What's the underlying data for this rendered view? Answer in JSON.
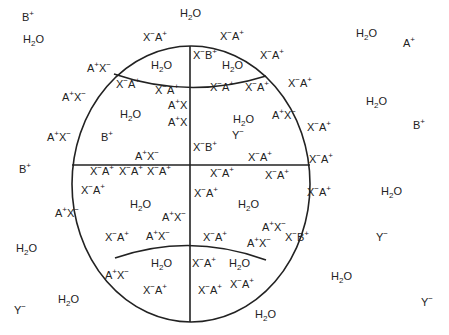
{
  "figure": {
    "stroke_color": "#222222",
    "background": "#ffffff"
  },
  "labels": [
    {
      "id": "out-b1",
      "text": "B+",
      "x": 22,
      "y": 16,
      "region": "outside"
    },
    {
      "id": "out-h2o1",
      "text": "H2O",
      "x": 180,
      "y": 12,
      "region": "outside"
    },
    {
      "id": "out-h2o2",
      "text": "H2O",
      "x": 23,
      "y": 38,
      "region": "outside"
    },
    {
      "id": "out-h2o3",
      "text": "H2O",
      "x": 356,
      "y": 32,
      "region": "outside"
    },
    {
      "id": "out-a1",
      "text": "A+",
      "x": 403,
      "y": 42,
      "region": "outside"
    },
    {
      "id": "out-h2o4",
      "text": "H2O",
      "x": 366,
      "y": 100,
      "region": "outside"
    },
    {
      "id": "out-b2",
      "text": "B+",
      "x": 413,
      "y": 124,
      "region": "outside"
    },
    {
      "id": "out-b3",
      "text": "B+",
      "x": 19,
      "y": 168,
      "region": "outside"
    },
    {
      "id": "out-h2o5",
      "text": "H2O",
      "x": 381,
      "y": 190,
      "region": "outside"
    },
    {
      "id": "out-y1",
      "text": "Y-",
      "x": 376,
      "y": 236,
      "region": "outside"
    },
    {
      "id": "out-h2o6",
      "text": "H2O",
      "x": 16,
      "y": 247,
      "region": "outside"
    },
    {
      "id": "out-h2o7",
      "text": "H2O",
      "x": 331,
      "y": 275,
      "region": "outside"
    },
    {
      "id": "out-h2o8",
      "text": "H2O",
      "x": 58,
      "y": 298,
      "region": "outside"
    },
    {
      "id": "out-y2",
      "text": "Y-",
      "x": 14,
      "y": 309,
      "region": "outside"
    },
    {
      "id": "out-y3",
      "text": "Y-",
      "x": 421,
      "y": 301,
      "region": "outside"
    },
    {
      "id": "out-h2o9",
      "text": "H2O",
      "x": 255,
      "y": 313,
      "region": "outside"
    },
    {
      "id": "r-xa-top1",
      "text": "X-A+",
      "x": 143,
      "y": 36,
      "region": "rim"
    },
    {
      "id": "r-xa-top2",
      "text": "X-A+",
      "x": 220,
      "y": 35,
      "region": "rim"
    },
    {
      "id": "r-ax-l1",
      "text": "A+X-",
      "x": 87,
      "y": 67,
      "region": "rim"
    },
    {
      "id": "r-xa-r1",
      "text": "X-A+",
      "x": 260,
      "y": 54,
      "region": "rim"
    },
    {
      "id": "r-ax-l2",
      "text": "A+X-",
      "x": 62,
      "y": 96,
      "region": "rim"
    },
    {
      "id": "r-xa-r2",
      "text": "X-A+",
      "x": 288,
      "y": 82,
      "region": "rim"
    },
    {
      "id": "r-ax-l3",
      "text": "A+X-",
      "x": 47,
      "y": 136,
      "region": "rim"
    },
    {
      "id": "r-xa-r3",
      "text": "X-A+",
      "x": 307,
      "y": 126,
      "region": "rim"
    },
    {
      "id": "r-xa-r4",
      "text": "X-A+",
      "x": 309,
      "y": 158,
      "region": "rim"
    },
    {
      "id": "r-ax-l4",
      "text": "A+X-",
      "x": 55,
      "y": 212,
      "region": "rim"
    },
    {
      "id": "r-xa-r5",
      "text": "X-A+",
      "x": 307,
      "y": 191,
      "region": "rim"
    },
    {
      "id": "r-xb-r1",
      "text": "X-B+",
      "x": 285,
      "y": 236,
      "region": "rim"
    },
    {
      "id": "r-ax-l5",
      "text": "A+X-",
      "x": 105,
      "y": 274,
      "region": "rim"
    },
    {
      "id": "r-xa-b1",
      "text": "X-A+",
      "x": 143,
      "y": 289,
      "region": "rim"
    },
    {
      "id": "r-xa-b2",
      "text": "X-A+",
      "x": 198,
      "y": 289,
      "region": "rim"
    },
    {
      "id": "r-xa-b3",
      "text": "X-A+",
      "x": 230,
      "y": 283,
      "region": "rim"
    },
    {
      "id": "i-xb1",
      "text": "X-B+",
      "x": 193,
      "y": 54,
      "region": "inside"
    },
    {
      "id": "i-h2o1",
      "text": "H2O",
      "x": 151,
      "y": 64,
      "region": "inside"
    },
    {
      "id": "i-h2o2",
      "text": "H2O",
      "x": 222,
      "y": 64,
      "region": "inside"
    },
    {
      "id": "i-xa1",
      "text": "X-A+",
      "x": 116,
      "y": 83,
      "region": "inside"
    },
    {
      "id": "i-xa2",
      "text": "X-A+",
      "x": 155,
      "y": 89,
      "region": "inside"
    },
    {
      "id": "i-xa3",
      "text": "X-A+",
      "x": 210,
      "y": 86,
      "region": "inside"
    },
    {
      "id": "i-xa4",
      "text": "X-A+",
      "x": 245,
      "y": 86,
      "region": "inside"
    },
    {
      "id": "i-ax1",
      "text": "A+X",
      "x": 168,
      "y": 104,
      "region": "inside"
    },
    {
      "id": "i-h2o3",
      "text": "H2O",
      "x": 120,
      "y": 113,
      "region": "inside"
    },
    {
      "id": "i-ax2",
      "text": "A+X",
      "x": 168,
      "y": 121,
      "region": "inside"
    },
    {
      "id": "i-h2o4",
      "text": "H2O",
      "x": 233,
      "y": 118,
      "region": "inside"
    },
    {
      "id": "i-ax3",
      "text": "A+X-",
      "x": 272,
      "y": 114,
      "region": "inside"
    },
    {
      "id": "i-b1",
      "text": "B+",
      "x": 101,
      "y": 136,
      "region": "inside"
    },
    {
      "id": "i-y1",
      "text": "Y-",
      "x": 232,
      "y": 134,
      "region": "inside"
    },
    {
      "id": "i-xb2",
      "text": "X-B+",
      "x": 193,
      "y": 146,
      "region": "inside"
    },
    {
      "id": "i-ax4",
      "text": "A+X-",
      "x": 135,
      "y": 155,
      "region": "inside"
    },
    {
      "id": "i-xa5",
      "text": "X-A+",
      "x": 248,
      "y": 156,
      "region": "inside"
    },
    {
      "id": "i-xa6",
      "text": "X-A+",
      "x": 90,
      "y": 170,
      "region": "inside"
    },
    {
      "id": "i-xa7",
      "text": "X-A+",
      "x": 119,
      "y": 170,
      "region": "inside"
    },
    {
      "id": "i-xa8",
      "text": "X-A+",
      "x": 147,
      "y": 170,
      "region": "inside"
    },
    {
      "id": "i-xa9",
      "text": "X-A+",
      "x": 210,
      "y": 172,
      "region": "inside"
    },
    {
      "id": "i-xa10",
      "text": "X-A+",
      "x": 265,
      "y": 174,
      "region": "inside"
    },
    {
      "id": "i-xa11",
      "text": "X-A+",
      "x": 81,
      "y": 189,
      "region": "inside"
    },
    {
      "id": "i-xa12",
      "text": "X-A+",
      "x": 194,
      "y": 192,
      "region": "inside"
    },
    {
      "id": "i-h2o5",
      "text": "H2O",
      "x": 130,
      "y": 203,
      "region": "inside"
    },
    {
      "id": "i-h2o6",
      "text": "H2O",
      "x": 238,
      "y": 203,
      "region": "inside"
    },
    {
      "id": "i-ax5",
      "text": "A+X-",
      "x": 162,
      "y": 216,
      "region": "inside"
    },
    {
      "id": "i-ax6",
      "text": "A+X-",
      "x": 262,
      "y": 226,
      "region": "inside"
    },
    {
      "id": "i-xa13",
      "text": "X-A+",
      "x": 105,
      "y": 236,
      "region": "inside"
    },
    {
      "id": "i-ax7",
      "text": "A+X-",
      "x": 146,
      "y": 235,
      "region": "inside"
    },
    {
      "id": "i-xa14",
      "text": "X-A+",
      "x": 203,
      "y": 236,
      "region": "inside"
    },
    {
      "id": "i-ax8",
      "text": "A+X-",
      "x": 247,
      "y": 242,
      "region": "inside"
    },
    {
      "id": "i-h2o7",
      "text": "H2O",
      "x": 151,
      "y": 262,
      "region": "inside"
    },
    {
      "id": "i-xa15",
      "text": "X-A+",
      "x": 192,
      "y": 262,
      "region": "inside"
    },
    {
      "id": "i-h2o8",
      "text": "H2O",
      "x": 229,
      "y": 262,
      "region": "inside"
    }
  ]
}
